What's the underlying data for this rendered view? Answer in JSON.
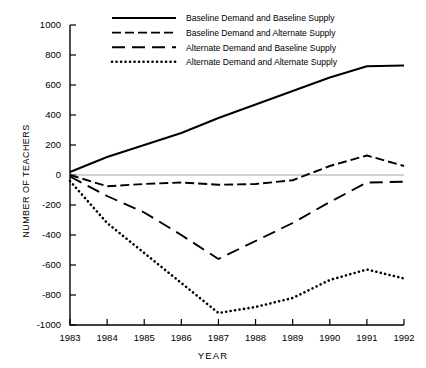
{
  "chart_data": {
    "type": "line",
    "title": "",
    "xlabel": "YEAR",
    "ylabel": "NUMBER OF TEACHERS",
    "x": [
      1983,
      1984,
      1985,
      1986,
      1987,
      1988,
      1989,
      1990,
      1991,
      1992
    ],
    "categories": [
      "1983",
      "1984",
      "1985",
      "1986",
      "1987",
      "1988",
      "1989",
      "1990",
      "1991",
      "1992"
    ],
    "xlim": [
      1983,
      1992
    ],
    "ylim": [
      -1000,
      1000
    ],
    "yticks": [
      -1000,
      -800,
      -600,
      -400,
      -200,
      0,
      200,
      400,
      600,
      800,
      1000
    ],
    "ytick_labels": [
      "-1000",
      "-800",
      "-600",
      "-400",
      "-200",
      "0",
      "200",
      "400",
      "600",
      "800",
      "1000"
    ],
    "xticks": [
      1983,
      1984,
      1985,
      1986,
      1987,
      1988,
      1989,
      1990,
      1991,
      1992
    ],
    "grid": false,
    "zero_line": true,
    "legend_position": "top-center",
    "series": [
      {
        "name": "Baseline Demand and Baseline Supply",
        "style": "solid",
        "values": [
          20,
          120,
          200,
          280,
          380,
          470,
          560,
          650,
          725,
          730
        ]
      },
      {
        "name": "Baseline Demand and Alternate Supply",
        "style": "short-dash",
        "values": [
          0,
          -75,
          -60,
          -50,
          -65,
          -60,
          -35,
          60,
          130,
          60
        ]
      },
      {
        "name": "Alternate Demand and Baseline Supply",
        "style": "long-dash",
        "values": [
          -10,
          -140,
          -250,
          -400,
          -560,
          -440,
          -320,
          -180,
          -50,
          -45
        ]
      },
      {
        "name": "Alternate Demand and Alternate Supply",
        "style": "dotted",
        "values": [
          -40,
          -320,
          -520,
          -720,
          -920,
          -880,
          -820,
          -700,
          -630,
          -690
        ]
      }
    ]
  },
  "legend": {
    "items": [
      {
        "label": "Baseline Demand and Baseline Supply",
        "style": "solid"
      },
      {
        "label": "Baseline Demand and Alternate Supply",
        "style": "short-dash"
      },
      {
        "label": "Alternate Demand and Baseline Supply",
        "style": "long-dash"
      },
      {
        "label": "Alternate Demand and Alternate Supply",
        "style": "dotted"
      }
    ]
  },
  "axes": {
    "y_title": "NUMBER OF TEACHERS",
    "x_title": "YEAR"
  }
}
